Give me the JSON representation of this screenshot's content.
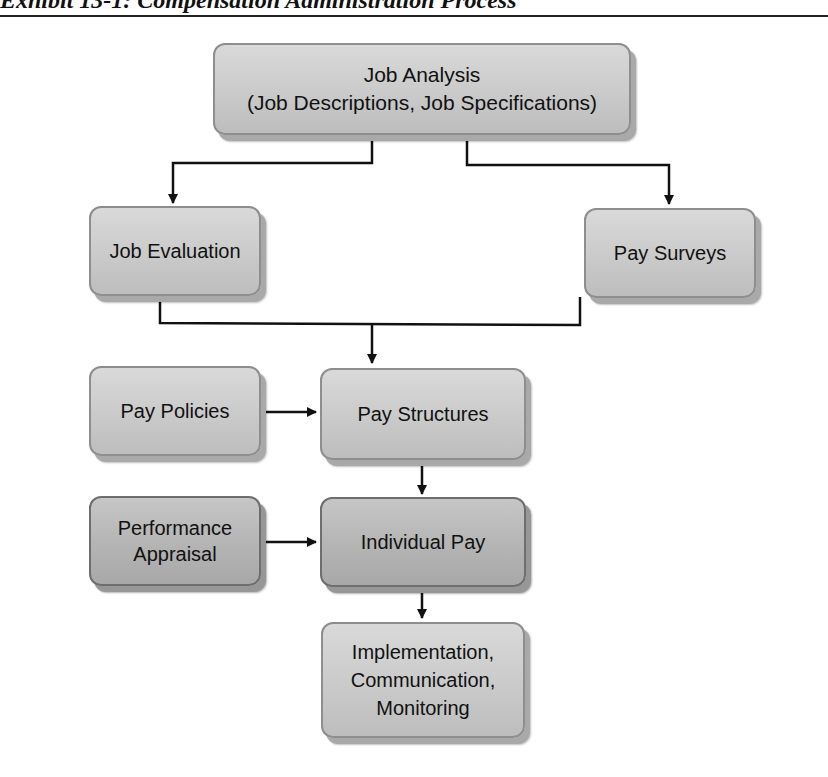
{
  "figure": {
    "title": "Exhibit 13-1: Compensation Administration Process"
  },
  "nodes": {
    "job_analysis": "Job Analysis\n(Job Descriptions, Job Specifications)",
    "job_evaluation": "Job Evaluation",
    "pay_surveys": "Pay Surveys",
    "pay_policies": "Pay Policies",
    "pay_structures": "Pay Structures",
    "performance_appraisal": "Performance\nAppraisal",
    "individual_pay": "Individual Pay",
    "implementation": "Implementation,\nCommunication,\nMonitoring"
  },
  "edges": [
    {
      "from": "Job Analysis",
      "to": "Job Evaluation"
    },
    {
      "from": "Job Analysis",
      "to": "Pay Surveys"
    },
    {
      "from": "Job Evaluation",
      "to": "Pay Structures"
    },
    {
      "from": "Pay Surveys",
      "to": "Pay Structures"
    },
    {
      "from": "Pay Policies",
      "to": "Pay Structures"
    },
    {
      "from": "Pay Structures",
      "to": "Individual Pay"
    },
    {
      "from": "Performance Appraisal",
      "to": "Individual Pay"
    },
    {
      "from": "Individual Pay",
      "to": "Implementation, Communication, Monitoring"
    }
  ],
  "colors": {
    "node_fill": "#cacaca",
    "node_fill_dark": "#b4b4b4",
    "connector": "#111111"
  }
}
